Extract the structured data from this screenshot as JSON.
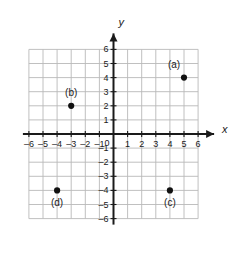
{
  "chart_data": {
    "type": "scatter",
    "title": "",
    "xlabel": "x",
    "ylabel": "y",
    "xlim": [
      -6,
      6
    ],
    "ylim": [
      -6,
      6
    ],
    "grid": true,
    "legend": "none",
    "x_ticks": [
      "–6",
      "–5",
      "–4",
      "–3",
      "–2",
      "–1",
      "1",
      "2",
      "3",
      "4",
      "5",
      "6"
    ],
    "x_tick_values": [
      -6,
      -5,
      -4,
      -3,
      -2,
      -1,
      1,
      2,
      3,
      4,
      5,
      6
    ],
    "y_ticks": [
      "6",
      "5",
      "4",
      "3",
      "2",
      "1",
      "–1",
      "–2",
      "–3",
      "–4",
      "–5",
      "–6"
    ],
    "y_tick_values": [
      6,
      5,
      4,
      3,
      2,
      1,
      -1,
      -2,
      -3,
      -4,
      -5,
      -6
    ],
    "origin_label": "0",
    "points": [
      {
        "label": "(a)",
        "x": 5,
        "y": 4,
        "label_dx": -10,
        "label_dy": -13
      },
      {
        "label": "(b)",
        "x": -3,
        "y": 2,
        "label_dx": 0,
        "label_dy": -13
      },
      {
        "label": "(c)",
        "x": 4,
        "y": -4,
        "label_dx": 0,
        "label_dy": 13
      },
      {
        "label": "(d)",
        "x": -4,
        "y": -4,
        "label_dx": 0,
        "label_dy": 13
      }
    ],
    "colors": {
      "point": "#111111",
      "grid": "#b9b9b9",
      "axis": "#1a1a1a",
      "background": "#ffffff"
    }
  }
}
